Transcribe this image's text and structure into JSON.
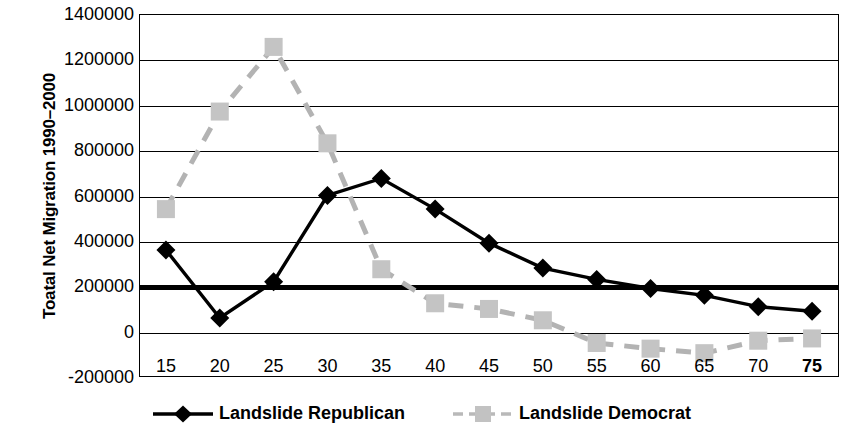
{
  "chart_data": {
    "type": "line",
    "title": "",
    "xlabel": "",
    "ylabel": "Toatal Net Migration 1990–2000",
    "x": [
      15,
      20,
      25,
      30,
      35,
      40,
      45,
      50,
      55,
      60,
      65,
      70,
      75
    ],
    "xticklabels": [
      "15",
      "20",
      "25",
      "30",
      "35",
      "40",
      "45",
      "50",
      "55",
      "60",
      "65",
      "70",
      "75"
    ],
    "yticklabels": [
      "1400000",
      "1200000",
      "1000000",
      "800000",
      "600000",
      "400000",
      "200000",
      "0",
      "-200000"
    ],
    "yticks": [
      1400000,
      1200000,
      1000000,
      800000,
      600000,
      400000,
      200000,
      0,
      -200000
    ],
    "ylim": [
      -200000,
      1400000
    ],
    "xlim": [
      12.5,
      77.5
    ],
    "grid": true,
    "legend_position": "bottom",
    "series": [
      {
        "name": "Landslide Republican",
        "color": "#000000",
        "marker": "diamond",
        "linestyle": "solid",
        "values": [
          360000,
          60000,
          220000,
          600000,
          675000,
          540000,
          390000,
          280000,
          230000,
          190000,
          160000,
          110000,
          90000
        ]
      },
      {
        "name": "Landslide Democrat",
        "color": "#b3b3b3",
        "marker": "square",
        "linestyle": "dashed",
        "values": [
          540000,
          970000,
          1255000,
          830000,
          275000,
          125000,
          100000,
          50000,
          -50000,
          -75000,
          -95000,
          -40000,
          -30000
        ]
      }
    ],
    "emphasis": {
      "bold_xticklabels": [
        "75"
      ],
      "bold_gridline_value": 200000
    }
  },
  "legend": {
    "items": [
      {
        "label": "Landslide Republican",
        "icon": "black-diamond-line-icon"
      },
      {
        "label": "Landslide Democrat",
        "icon": "gray-square-dashed-line-icon"
      }
    ]
  }
}
